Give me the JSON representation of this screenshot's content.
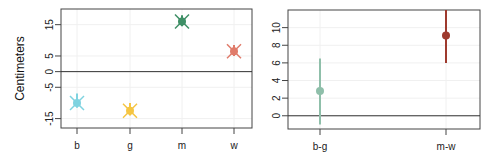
{
  "chart_data": [
    {
      "type": "scatter",
      "title": "",
      "xlabel": "",
      "ylabel": "Centimeters",
      "categories": [
        "b",
        "g",
        "m",
        "w"
      ],
      "values": [
        -10,
        -12.5,
        16,
        6.5
      ],
      "ci_low": [
        -11.5,
        -14,
        14.5,
        5
      ],
      "ci_high": [
        -7,
        -10,
        18,
        8.5
      ],
      "colors": [
        "#7fd3e0",
        "#f5c542",
        "#3e8f66",
        "#e07b6a"
      ],
      "marker": "point-with-x",
      "yticks": [
        -15,
        -5,
        0,
        5,
        15
      ],
      "ylim": [
        -18,
        20
      ],
      "reference_line": 0,
      "grid": true
    },
    {
      "type": "scatter",
      "title": "",
      "xlabel": "",
      "ylabel": "",
      "categories": [
        "b-g",
        "m-w"
      ],
      "values": [
        2.8,
        9.1
      ],
      "ci_low": [
        -1,
        6
      ],
      "ci_high": [
        6.5,
        12
      ],
      "colors": [
        "#8fbfaa",
        "#9e3a2e"
      ],
      "marker": "point-with-errorbar",
      "yticks": [
        0,
        2,
        4,
        6,
        8,
        10
      ],
      "ylim": [
        -1.5,
        12
      ],
      "reference_line": 0,
      "grid": true
    }
  ]
}
